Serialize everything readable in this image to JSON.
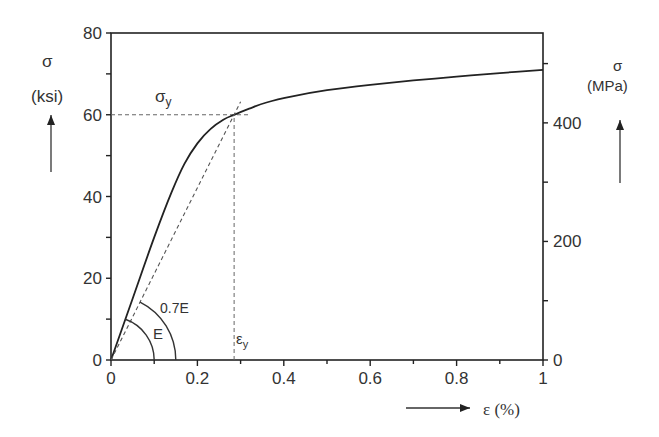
{
  "chart_data": {
    "type": "line",
    "title": "",
    "xlabel": "ε (%)",
    "ylabel_left": {
      "symbol": "σ",
      "unit": "(ksi)"
    },
    "ylabel_right": {
      "symbol": "σ",
      "unit": "(MPa)"
    },
    "xlim": [
      0,
      1
    ],
    "ylim_left": [
      0,
      80
    ],
    "ylim_right": [
      0,
      551.6
    ],
    "x_ticks": [
      "0",
      "0.2",
      "0.4",
      "0.6",
      "0.8",
      "1"
    ],
    "y_ticks_left": [
      "0",
      "20",
      "40",
      "60",
      "80"
    ],
    "y_ticks_right": [
      "0",
      "200",
      "400"
    ],
    "grid": false,
    "series": [
      {
        "name": "stress-strain curve",
        "style": "solid",
        "x": [
          0,
          0.05,
          0.1,
          0.14,
          0.17,
          0.2,
          0.23,
          0.26,
          0.285,
          0.32,
          0.36,
          0.42,
          0.5,
          0.6,
          0.7,
          0.8,
          0.9,
          1.0
        ],
        "y": [
          0,
          15,
          30,
          41,
          48,
          53,
          56.5,
          58.8,
          60,
          61.5,
          63,
          64.5,
          66,
          67.3,
          68.4,
          69.3,
          70.2,
          71
        ]
      },
      {
        "name": "0.7E secant line",
        "style": "dashed",
        "x": [
          0,
          0.3
        ],
        "y": [
          0,
          63.2
        ]
      }
    ],
    "annotations": [
      {
        "text": "σy",
        "type": "horizontal-dashed",
        "y": 60,
        "x_range": [
          0,
          0.32
        ]
      },
      {
        "text": "εy",
        "type": "vertical-dashed",
        "x": 0.285,
        "y_range": [
          0,
          60
        ]
      },
      {
        "text": "E",
        "type": "arc",
        "radius_x": 0.1
      },
      {
        "text": "0.7E",
        "type": "arc",
        "radius_x": 0.15
      }
    ]
  },
  "labels": {
    "sigma_left": "σ",
    "ksi": "(ksi)",
    "sigma_right": "σ",
    "mpa": "(MPa)",
    "sigma_y": "σ",
    "sigma_y_sub": "y",
    "eps_y": "ε",
    "eps_y_sub": "y",
    "E": "E",
    "E07": "0.7E",
    "xlabel": "ε (%)"
  }
}
